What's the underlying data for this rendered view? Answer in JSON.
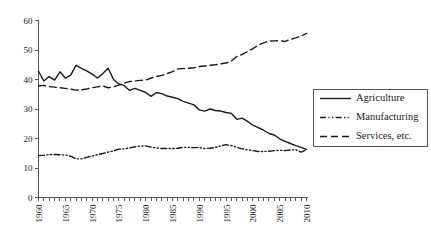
{
  "chart_data": {
    "type": "line",
    "title": "",
    "subtitle": "",
    "xlabel": "",
    "ylabel": "",
    "xlim": [
      1960,
      2010
    ],
    "ylim": [
      0,
      60
    ],
    "yticks": [
      0,
      10,
      20,
      30,
      40,
      50,
      60
    ],
    "xticks_labeled": [
      1960,
      1965,
      1970,
      1975,
      1980,
      1985,
      1990,
      1995,
      2000,
      2005,
      2010
    ],
    "xtick_step_minor": 1,
    "grid": false,
    "legend_position": "right",
    "x": [
      1960,
      1961,
      1962,
      1963,
      1964,
      1965,
      1966,
      1967,
      1968,
      1969,
      1970,
      1971,
      1972,
      1973,
      1974,
      1975,
      1976,
      1977,
      1978,
      1979,
      1980,
      1981,
      1982,
      1983,
      1984,
      1985,
      1986,
      1987,
      1988,
      1989,
      1990,
      1991,
      1992,
      1993,
      1994,
      1995,
      1996,
      1997,
      1998,
      1999,
      2000,
      2001,
      2002,
      2003,
      2004,
      2005,
      2006,
      2007,
      2008,
      2009,
      2010
    ],
    "series": [
      {
        "name": "Agriculture",
        "style": "solid",
        "color": "#1a1a1a",
        "values": [
          42.8,
          39.5,
          41.0,
          39.8,
          42.6,
          40.5,
          41.5,
          44.8,
          43.8,
          42.9,
          41.8,
          40.5,
          42.0,
          43.8,
          40.0,
          38.5,
          37.9,
          36.3,
          37.0,
          36.3,
          35.6,
          34.3,
          35.6,
          35.2,
          34.4,
          34.0,
          33.5,
          32.6,
          32.0,
          31.4,
          29.7,
          29.3,
          30.0,
          29.5,
          29.3,
          28.8,
          28.5,
          26.5,
          26.9,
          25.8,
          24.5,
          23.7,
          22.8,
          21.7,
          21.2,
          19.9,
          19.0,
          18.3,
          17.6,
          17.0,
          16.3
        ]
      },
      {
        "name": "Manufacturing",
        "style": "dash-dot",
        "color": "#1a1a1a",
        "values": [
          14.2,
          14.3,
          14.6,
          14.6,
          14.5,
          14.4,
          14.0,
          13.1,
          13.1,
          13.6,
          14.1,
          14.5,
          14.9,
          15.4,
          15.8,
          16.4,
          16.5,
          16.8,
          17.2,
          17.4,
          17.5,
          17.1,
          16.8,
          16.6,
          16.6,
          16.6,
          16.7,
          17.0,
          17.0,
          16.9,
          16.9,
          16.6,
          16.7,
          17.0,
          17.5,
          17.9,
          17.6,
          17.0,
          16.5,
          16.2,
          15.9,
          15.6,
          15.6,
          15.7,
          15.9,
          16.0,
          15.9,
          16.1,
          16.2,
          15.4,
          16.2
        ]
      },
      {
        "name": "Services, etc.",
        "style": "dashed",
        "color": "#1a1a1a",
        "values": [
          37.8,
          38.0,
          37.6,
          37.4,
          37.2,
          37.0,
          36.7,
          36.4,
          36.5,
          36.8,
          37.2,
          37.5,
          37.8,
          37.2,
          37.5,
          38.1,
          38.8,
          39.3,
          39.5,
          39.7,
          39.8,
          40.5,
          41.0,
          41.4,
          42.0,
          42.7,
          43.6,
          43.7,
          43.8,
          44.0,
          44.4,
          44.6,
          44.8,
          45.0,
          45.3,
          45.6,
          46.3,
          47.8,
          48.5,
          49.5,
          50.5,
          51.6,
          52.4,
          53.0,
          53.1,
          53.2,
          52.9,
          53.6,
          54.1,
          54.8,
          55.6
        ]
      }
    ]
  },
  "legend": {
    "items": [
      {
        "label": "Agriculture",
        "style": "solid"
      },
      {
        "label": "Manufacturing",
        "style": "dash-dot"
      },
      {
        "label": "Services, etc.",
        "style": "dashed"
      }
    ]
  },
  "colors": {
    "background": "#ffffff",
    "ink": "#1a1a1a",
    "axis": "#555555"
  }
}
